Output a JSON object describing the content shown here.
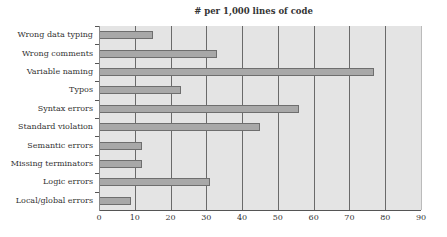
{
  "chart_data": {
    "type": "bar",
    "orientation": "horizontal",
    "title": "# per 1,000 lines of code",
    "xlabel": "",
    "ylabel": "",
    "categories": [
      "Wrong data typing",
      "Wrong comments",
      "Variable naming",
      "Typos",
      "Syntax errors",
      "Standard violation",
      "Semantic errors",
      "Missing terminators",
      "Logic errors",
      "Local/global errors"
    ],
    "values": [
      15,
      33,
      77,
      23,
      56,
      45,
      12,
      12,
      31,
      9
    ],
    "xlim": [
      0,
      90
    ],
    "xticks": [
      0,
      10,
      20,
      30,
      40,
      50,
      60,
      70,
      80,
      90
    ],
    "grid": "vertical",
    "legend": "none",
    "colors": {
      "bar": "#a8a8a8",
      "bar_border": "#6e6e6e",
      "plot_bg": "#e4e4e4",
      "grid": "#6a6a6a"
    }
  },
  "title": "# per 1,000 lines of code",
  "categories": [
    "Wrong data typing",
    "Wrong comments",
    "Variable naming",
    "Typos",
    "Syntax errors",
    "Standard violation",
    "Semantic errors",
    "Missing terminators",
    "Logic errors",
    "Local/global errors"
  ],
  "xticks": [
    "0",
    "10",
    "20",
    "30",
    "40",
    "50",
    "60",
    "70",
    "80",
    "90"
  ]
}
